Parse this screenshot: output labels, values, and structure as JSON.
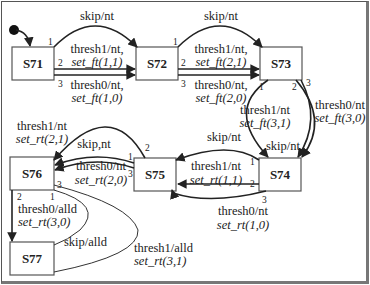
{
  "diagram": {
    "type": "state-machine",
    "states": [
      {
        "id": "S71",
        "label": "S71"
      },
      {
        "id": "S72",
        "label": "S72"
      },
      {
        "id": "S73",
        "label": "S73"
      },
      {
        "id": "S74",
        "label": "S74"
      },
      {
        "id": "S75",
        "label": "S75"
      },
      {
        "id": "S76",
        "label": "S76"
      },
      {
        "id": "S77",
        "label": "S77"
      }
    ],
    "initial_state": "S71",
    "transitions": [
      {
        "from": "S71",
        "to": "S72",
        "port": "1",
        "event": "skip/nt",
        "action": ""
      },
      {
        "from": "S71",
        "to": "S72",
        "port": "2",
        "event": "thresh1/nt,",
        "action": "set_ft(1,1)"
      },
      {
        "from": "S71",
        "to": "S72",
        "port": "3",
        "event": "thresh0/nt,",
        "action": "set_ft(1,0)"
      },
      {
        "from": "S72",
        "to": "S73",
        "port": "1",
        "event": "skip/nt",
        "action": ""
      },
      {
        "from": "S72",
        "to": "S73",
        "port": "2",
        "event": "thresh1/nt,",
        "action": "set_ft(2,1)"
      },
      {
        "from": "S72",
        "to": "S73",
        "port": "3",
        "event": "thresh0/nt,",
        "action": "set_ft(2,0)"
      },
      {
        "from": "S73",
        "to": "S74",
        "port": "1",
        "event": "skip/nt",
        "action": ""
      },
      {
        "from": "S73",
        "to": "S74",
        "port": "2",
        "event": "thresh1/nt",
        "action": "set_ft(3,1)"
      },
      {
        "from": "S73",
        "to": "S74",
        "port": "3",
        "event": "thresh0/nt",
        "action": "set_ft(3,0)"
      },
      {
        "from": "S74",
        "to": "S75",
        "port": "1",
        "event": "skip/nt",
        "action": ""
      },
      {
        "from": "S74",
        "to": "S75",
        "port": "2",
        "event": "thresh1/nt",
        "action": "set_rt(1,1)"
      },
      {
        "from": "S74",
        "to": "S75",
        "port": "3",
        "event": "thresh0/nt",
        "action": "set_rt(1,0)"
      },
      {
        "from": "S75",
        "to": "S76",
        "port": "1",
        "event": "skip,nt",
        "action": ""
      },
      {
        "from": "S75",
        "to": "S76",
        "port": "2",
        "event": "thresh1/nt",
        "action": "set_rt(2,1)"
      },
      {
        "from": "S75",
        "to": "S76",
        "port": "3",
        "event": "thresh0/nt",
        "action": "set_rt(2,0)"
      },
      {
        "from": "S76",
        "to": "S77",
        "port": "1",
        "event": "skip/alld",
        "action": ""
      },
      {
        "from": "S76",
        "to": "S77",
        "port": "2",
        "event": "thresh0/alld",
        "action": "set_rt(3,0)"
      },
      {
        "from": "S76",
        "to": "S77",
        "port": "3",
        "event": "thresh1/alld",
        "action": "set_rt(3,1)"
      }
    ]
  }
}
